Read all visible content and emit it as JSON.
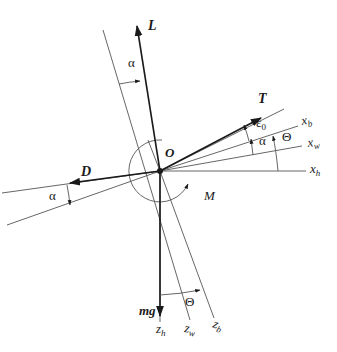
{
  "diagram": {
    "origin": {
      "label": "O",
      "x": 160,
      "y": 171
    },
    "forces": [
      {
        "id": "lift",
        "label": "L",
        "tip": [
          137,
          24
        ]
      },
      {
        "id": "thrust",
        "label": "T",
        "tip": [
          262,
          117
        ]
      },
      {
        "id": "drag",
        "label": "D",
        "tip": [
          68,
          186
        ]
      },
      {
        "id": "weight",
        "label": "mg",
        "tip": [
          160,
          318
        ]
      }
    ],
    "moment": {
      "label": "M"
    },
    "axes": [
      {
        "id": "x_b",
        "label": "x",
        "sub": "b"
      },
      {
        "id": "x_w",
        "label": "x",
        "sub": "w"
      },
      {
        "id": "x_h",
        "label": "x",
        "sub": "h"
      },
      {
        "id": "z_h",
        "label": "z",
        "sub": "h"
      },
      {
        "id": "z_w",
        "label": "z",
        "sub": "w"
      },
      {
        "id": "z_b",
        "label": "z",
        "sub": "b"
      }
    ],
    "angles": {
      "alpha": "α",
      "theta": "Θ",
      "epsilon": "ε",
      "epsilon_sub": "0"
    }
  }
}
